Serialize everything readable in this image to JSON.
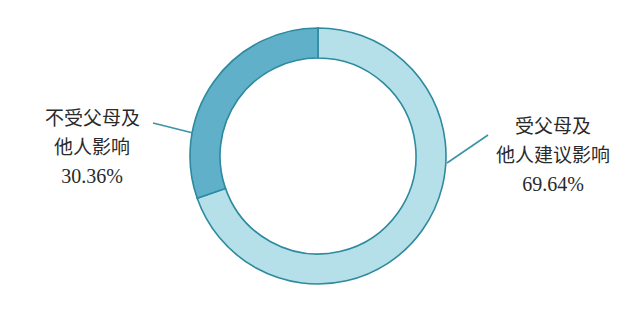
{
  "chart_data": {
    "type": "pie",
    "subtype": "donut",
    "title": "",
    "categories": [
      "受父母及他人建议影响",
      "不受父母及他人影响"
    ],
    "values": [
      69.64,
      30.36
    ],
    "unit": "%",
    "start_angle_deg": 0,
    "direction": "clockwise",
    "legend": "none (callout labels with leader lines)",
    "slices": [
      {
        "name": "受父母及他人建议影响",
        "label_lines": [
          "受父母及",
          "他人建议影响"
        ],
        "value": 69.64,
        "value_text": "69.64%",
        "color": "#b5e0ea",
        "label_position": "right"
      },
      {
        "name": "不受父母及他人影响",
        "label_lines": [
          "不受父母及",
          "他人影响"
        ],
        "value": 30.36,
        "value_text": "30.36%",
        "color": "#5fb0c8",
        "label_position": "left"
      }
    ]
  },
  "colors": {
    "stroke": "#2e8a9e",
    "leader_line": "#3a93a8",
    "text": "#2a2a2a",
    "background": "#ffffff"
  },
  "labels": {
    "left": {
      "line1": "不受父母及",
      "line2": "他人影响",
      "pct": "30.36%"
    },
    "right": {
      "line1": "受父母及",
      "line2": "他人建议影响",
      "pct": "69.64%"
    }
  }
}
